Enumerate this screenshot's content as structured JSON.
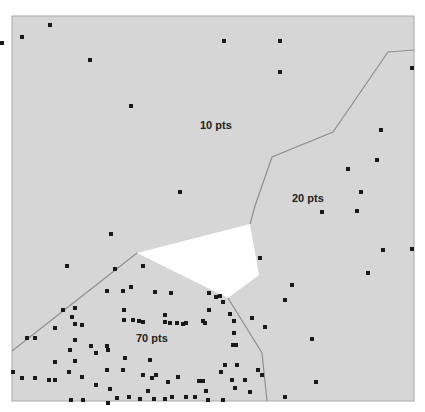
{
  "frame": {
    "x": 12,
    "y": 16,
    "w": 402,
    "h": 385,
    "fill": "#d6d6d6",
    "border": "#a8a8a8"
  },
  "regions": [
    {
      "name": "region-10pts",
      "label": "10 pts",
      "label_pos": [
        200,
        119
      ]
    },
    {
      "name": "region-20pts",
      "label": "20 pts",
      "label_pos": [
        292,
        192
      ]
    },
    {
      "name": "region-70pts",
      "label": "70 pts",
      "label_pos": [
        136,
        332
      ]
    }
  ],
  "empty_cell": {
    "polygon": [
      [
        137,
        253
      ],
      [
        250,
        224
      ],
      [
        259,
        275
      ],
      [
        228,
        298
      ]
    ],
    "fill": "#ffffff"
  },
  "boundaries": [
    [
      [
        414,
        50
      ],
      [
        388,
        52
      ],
      [
        333,
        132
      ],
      [
        272,
        157
      ],
      [
        255,
        206
      ],
      [
        250,
        224
      ]
    ],
    [
      [
        137,
        253
      ],
      [
        12,
        351
      ]
    ],
    [
      [
        228,
        298
      ],
      [
        262,
        353
      ],
      [
        267,
        401
      ]
    ]
  ],
  "boundary_color": "#8f8f8f",
  "points": [
    [
      2,
      43
    ],
    [
      22,
      37
    ],
    [
      50,
      25
    ],
    [
      90,
      60
    ],
    [
      131,
      106
    ],
    [
      180,
      192
    ],
    [
      224,
      41
    ],
    [
      280,
      41
    ],
    [
      280,
      72
    ],
    [
      412,
      68
    ],
    [
      381,
      130
    ],
    [
      377,
      160
    ],
    [
      348,
      169
    ],
    [
      361,
      192
    ],
    [
      357,
      211
    ],
    [
      260,
      258
    ],
    [
      322,
      212
    ],
    [
      383,
      250
    ],
    [
      412,
      249
    ],
    [
      368,
      273
    ],
    [
      292,
      285
    ],
    [
      285,
      300
    ],
    [
      252,
      318
    ],
    [
      265,
      327
    ],
    [
      312,
      339
    ],
    [
      316,
      382
    ],
    [
      285,
      397
    ],
    [
      111,
      234
    ],
    [
      67,
      266
    ],
    [
      115,
      269
    ],
    [
      143,
      266
    ],
    [
      131,
      287
    ],
    [
      123,
      291
    ],
    [
      107,
      291
    ],
    [
      155,
      292
    ],
    [
      171,
      293
    ],
    [
      209,
      293
    ],
    [
      216,
      297
    ],
    [
      220,
      296
    ],
    [
      75,
      308
    ],
    [
      72,
      317
    ],
    [
      63,
      310
    ],
    [
      75,
      324
    ],
    [
      82,
      325
    ],
    [
      55,
      328
    ],
    [
      75,
      340
    ],
    [
      70,
      350
    ],
    [
      75,
      361
    ],
    [
      55,
      362
    ],
    [
      108,
      350
    ],
    [
      107,
      346
    ],
    [
      96,
      353
    ],
    [
      27,
      338
    ],
    [
      35,
      338
    ],
    [
      91,
      346
    ],
    [
      124,
      320
    ],
    [
      133,
      320
    ],
    [
      139,
      321
    ],
    [
      143,
      322
    ],
    [
      165,
      322
    ],
    [
      170,
      323
    ],
    [
      177,
      323
    ],
    [
      186,
      323
    ],
    [
      203,
      321
    ],
    [
      205,
      323
    ],
    [
      124,
      310
    ],
    [
      165,
      315
    ],
    [
      183,
      324
    ],
    [
      223,
      302
    ],
    [
      209,
      310
    ],
    [
      233,
      345
    ],
    [
      236,
      345
    ],
    [
      234,
      333
    ],
    [
      234,
      321
    ],
    [
      230,
      314
    ],
    [
      13,
      372
    ],
    [
      22,
      378
    ],
    [
      35,
      378
    ],
    [
      49,
      380
    ],
    [
      55,
      380
    ],
    [
      69,
      372
    ],
    [
      82,
      377
    ],
    [
      96,
      385
    ],
    [
      107,
      370
    ],
    [
      110,
      389
    ],
    [
      108,
      403
    ],
    [
      123,
      370
    ],
    [
      143,
      375
    ],
    [
      152,
      378
    ],
    [
      156,
      375
    ],
    [
      178,
      377
    ],
    [
      199,
      381
    ],
    [
      206,
      391
    ],
    [
      221,
      372
    ],
    [
      225,
      365
    ],
    [
      237,
      365
    ],
    [
      235,
      388
    ],
    [
      250,
      392
    ],
    [
      125,
      358
    ],
    [
      150,
      360
    ],
    [
      129,
      397
    ],
    [
      148,
      391
    ],
    [
      168,
      382
    ],
    [
      172,
      397
    ],
    [
      195,
      397
    ],
    [
      203,
      381
    ],
    [
      232,
      380
    ],
    [
      223,
      400
    ],
    [
      245,
      380
    ],
    [
      258,
      370
    ],
    [
      262,
      375
    ],
    [
      71,
      400
    ],
    [
      83,
      400
    ],
    [
      117,
      398
    ],
    [
      140,
      399
    ],
    [
      154,
      399
    ],
    [
      165,
      399
    ],
    [
      186,
      397
    ],
    [
      208,
      400
    ]
  ],
  "point_color": "#1a1a1a",
  "point_size": 4
}
